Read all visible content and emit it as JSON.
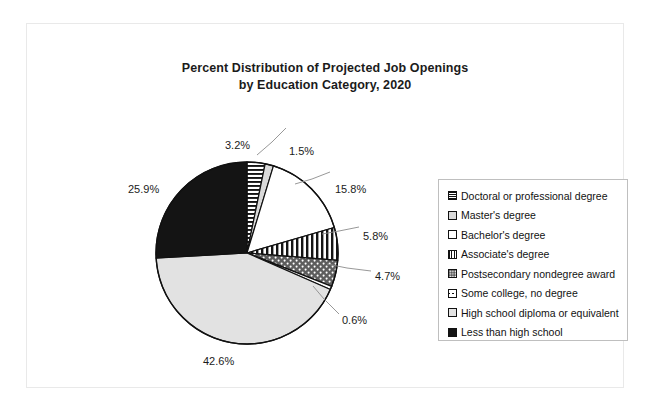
{
  "chart_data": {
    "type": "pie",
    "title": "Percent Distribution of Projected Job Openings by Education Category, 2020",
    "title_lines": [
      "Percent Distribution of Projected Job Openings",
      "by Education Category, 2020"
    ],
    "units": "percent",
    "legend_position": "right",
    "grid": false,
    "categories": [
      "Doctoral or professional degree",
      "Master's degree",
      "Bachelor's degree",
      "Associate's degree",
      "Postsecondary nondegree award",
      "Some college, no degree",
      "High school diploma or equivalent",
      "Less than high school"
    ],
    "values": [
      3.2,
      1.5,
      15.8,
      5.8,
      4.7,
      0.6,
      42.6,
      25.9
    ],
    "labels": [
      "3.2%",
      "1.5%",
      "15.8%",
      "5.8%",
      "4.7%",
      "0.6%",
      "42.6%",
      "25.9%"
    ],
    "slices": [
      {
        "label": "Doctoral or professional degree",
        "value": 3.2,
        "display": "3.2%",
        "pattern": "horizontal-stripes",
        "fill": "#ffffff",
        "ink": "#111111"
      },
      {
        "label": "Master's degree",
        "value": 1.5,
        "display": "1.5%",
        "pattern": "solid-light-gray",
        "fill": "#d9d9d9",
        "ink": "#111111"
      },
      {
        "label": "Bachelor's degree",
        "value": 15.8,
        "display": "15.8%",
        "pattern": "solid-white",
        "fill": "#ffffff",
        "ink": "#111111"
      },
      {
        "label": "Associate's degree",
        "value": 5.8,
        "display": "5.8%",
        "pattern": "vertical-stripes",
        "fill": "#ffffff",
        "ink": "#111111"
      },
      {
        "label": "Postsecondary nondegree award",
        "value": 4.7,
        "display": "4.7%",
        "pattern": "dark-dotted",
        "fill": "#5b5b5b",
        "ink": "#ffffff"
      },
      {
        "label": "Some college, no degree",
        "value": 0.6,
        "display": "0.6%",
        "pattern": "solid-white",
        "fill": "#ffffff",
        "ink": "#111111"
      },
      {
        "label": "High school diploma or equivalent",
        "value": 42.6,
        "display": "42.6%",
        "pattern": "solid-light-gray",
        "fill": "#e2e2e2",
        "ink": "#111111"
      },
      {
        "label": "Less than high school",
        "value": 25.9,
        "display": "25.9%",
        "pattern": "solid-black",
        "fill": "#141414",
        "ink": "#ffffff"
      }
    ],
    "start_angle_deg": 0,
    "direction": "clockwise"
  },
  "legend": {
    "items": [
      {
        "label": "Doctoral or professional degree"
      },
      {
        "label": "Master's degree"
      },
      {
        "label": "Bachelor's degree"
      },
      {
        "label": "Associate's degree"
      },
      {
        "label": "Postsecondary nondegree award"
      },
      {
        "label": "Some college, no degree"
      },
      {
        "label": "High school diploma or equivalent"
      },
      {
        "label": "Less than high school"
      }
    ]
  }
}
